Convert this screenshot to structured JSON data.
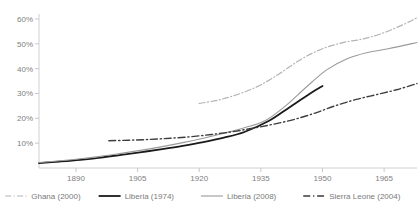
{
  "chart_data": {
    "type": "line",
    "title": "",
    "subtitle": "",
    "xlabel": "",
    "ylabel": "",
    "xlim": [
      1881,
      1973
    ],
    "ylim": [
      0,
      62
    ],
    "grid": false,
    "legend_position": "bottom",
    "xticks": [
      1890,
      1905,
      1920,
      1935,
      1950,
      1965
    ],
    "xtick_labels": [
      "1890",
      "1905",
      "1920",
      "1935",
      "1950",
      "1965"
    ],
    "yticks": [
      10,
      20,
      30,
      40,
      50,
      60
    ],
    "ytick_labels": [
      "10%",
      "20%",
      "30%",
      "40%",
      "50%",
      "60%"
    ],
    "series": [
      {
        "name": "Ghana (2000)",
        "color": "#b4b4b4",
        "style": "dash-dot",
        "width": 1.2,
        "x": [
          1920,
          1925,
          1930,
          1935,
          1940,
          1945,
          1950,
          1955,
          1960,
          1965,
          1970,
          1973
        ],
        "values": [
          26.0,
          27.5,
          30.0,
          33.5,
          38.5,
          44.0,
          48.0,
          50.5,
          52.0,
          54.5,
          58.0,
          60.5
        ]
      },
      {
        "name": "Liberia (1974)",
        "color": "#1a1a1a",
        "style": "solid",
        "width": 1.8,
        "x": [
          1881,
          1886,
          1891,
          1896,
          1901,
          1906,
          1911,
          1916,
          1921,
          1926,
          1931,
          1937,
          1942,
          1947,
          1950
        ],
        "values": [
          2.0,
          2.6,
          3.3,
          4.2,
          5.3,
          6.4,
          7.6,
          8.9,
          10.4,
          12.2,
          14.5,
          19.0,
          24.5,
          30.0,
          33.0
        ]
      },
      {
        "name": "Liberia (2008)",
        "color": "#9a9a9a",
        "style": "solid",
        "width": 1.1,
        "x": [
          1881,
          1886,
          1891,
          1896,
          1901,
          1906,
          1911,
          1916,
          1921,
          1926,
          1931,
          1936,
          1941,
          1946,
          1951,
          1956,
          1961,
          1966,
          1973
        ],
        "values": [
          2.2,
          2.9,
          3.7,
          4.7,
          5.9,
          7.2,
          8.6,
          10.2,
          12.0,
          14.0,
          16.2,
          19.0,
          25.0,
          32.5,
          39.5,
          44.0,
          46.5,
          48.0,
          50.5
        ]
      },
      {
        "name": "Sierra Leone (2004)",
        "color": "#3d3d3d",
        "style": "dash-dot",
        "width": 1.4,
        "x": [
          1898,
          1903,
          1908,
          1913,
          1918,
          1923,
          1928,
          1933,
          1938,
          1943,
          1948,
          1953,
          1958,
          1963,
          1968,
          1973
        ],
        "values": [
          11.0,
          11.2,
          11.5,
          12.0,
          12.6,
          13.5,
          14.6,
          16.0,
          17.6,
          19.5,
          22.0,
          25.0,
          27.5,
          29.5,
          31.5,
          34.0
        ]
      }
    ]
  },
  "legend": {
    "items": [
      {
        "label": "Ghana (2000)"
      },
      {
        "label": "Liberia (1974)"
      },
      {
        "label": "Liberia (2008)"
      },
      {
        "label": "Sierra Leone (2004)"
      }
    ]
  },
  "axis": {
    "line_color": "#d0d0d0",
    "tick_color": "#c8c8c8",
    "label_color": "#808080"
  }
}
